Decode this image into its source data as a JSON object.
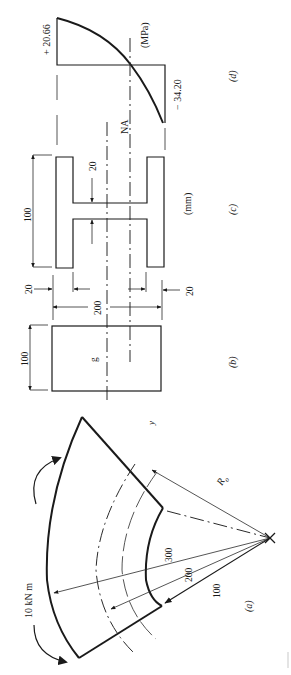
{
  "figure": {
    "orientation": "rotated 90 degrees counter-clockwise",
    "panels": [
      {
        "id": "a",
        "label": "(a)",
        "description": "curved beam under bending"
      },
      {
        "id": "b",
        "label": "(b)",
        "description": "rectangular cross-section"
      },
      {
        "id": "c",
        "label": "(c)",
        "description": "I-section cross-section"
      },
      {
        "id": "d",
        "label": "(d)",
        "description": "bending stress distribution"
      }
    ]
  },
  "panel_a": {
    "label": "(a)",
    "moment_label": "10 kN m",
    "radius_labels": [
      "300",
      "200",
      "100"
    ],
    "ro_label": "R",
    "ro_subscript": "o",
    "y_label": "y"
  },
  "panel_b": {
    "label": "(b)",
    "width_label": "100",
    "height_label": "200",
    "centroid_label": "g"
  },
  "panel_c": {
    "label": "(c)",
    "units": "(mm)",
    "flange_width_label": "100",
    "web_thickness_label": "20",
    "flange_thickness_top": "20",
    "flange_thickness_bottom": "20"
  },
  "panel_d": {
    "label": "(d)",
    "units": "(MPa)",
    "max_tension": "+ 20.66",
    "max_compression": "− 34.20",
    "neutral_axis_label": "NA"
  }
}
